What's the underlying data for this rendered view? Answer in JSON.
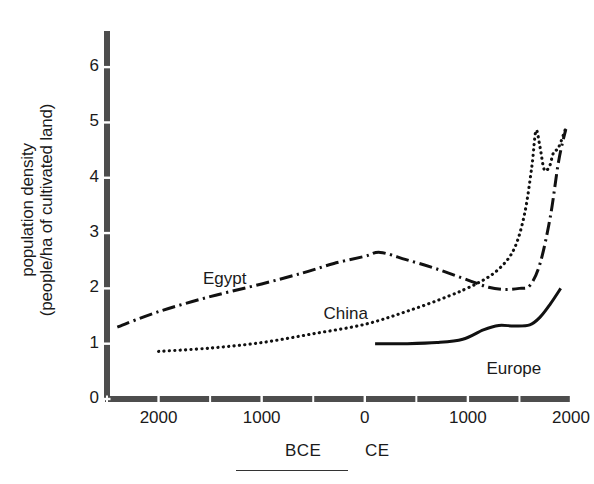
{
  "figure": {
    "axis_color": "#4d4d4d",
    "ink_color": "#111111"
  },
  "chart_data": {
    "type": "line",
    "title": "",
    "xlabel": "",
    "ylabel": "population density\n(people/ha of cultivated land)",
    "ylabel_line1": "population density",
    "ylabel_line2": "(people/ha of cultivated land)",
    "xlim": [
      -2500,
      2000
    ],
    "ylim": [
      0,
      6.4
    ],
    "grid": false,
    "legend": "inline-labels",
    "x_axis_caption_left": "BCE",
    "x_axis_caption_right": "CE",
    "y_ticks": [
      0,
      1,
      2,
      3,
      4,
      5,
      6
    ],
    "y_tick_labels": [
      "0",
      "1",
      "2",
      "3",
      "4",
      "5",
      "6"
    ],
    "x_ticks": [
      -2000,
      -1000,
      0,
      1000,
      2000
    ],
    "x_tick_labels": [
      "2000",
      "1000",
      "0",
      "1000",
      "2000"
    ],
    "series": [
      {
        "name": "Egypt",
        "style": "dash-dot",
        "color": "#111111",
        "label_x": -1550,
        "label_y": 2.35,
        "points": [
          [
            -2400,
            1.3
          ],
          [
            -2000,
            1.58
          ],
          [
            -1500,
            1.85
          ],
          [
            -1000,
            2.08
          ],
          [
            -600,
            2.28
          ],
          [
            -300,
            2.45
          ],
          [
            0,
            2.58
          ],
          [
            150,
            2.65
          ],
          [
            400,
            2.52
          ],
          [
            700,
            2.35
          ],
          [
            1000,
            2.15
          ],
          [
            1200,
            2.02
          ],
          [
            1350,
            1.98
          ],
          [
            1500,
            2.0
          ],
          [
            1600,
            2.05
          ],
          [
            1700,
            2.45
          ],
          [
            1800,
            3.3
          ],
          [
            1880,
            4.3
          ],
          [
            1950,
            4.88
          ]
        ]
      },
      {
        "name": "China",
        "style": "dotted",
        "color": "#111111",
        "label_x": -400,
        "label_y": 1.72,
        "points": [
          [
            -2000,
            0.86
          ],
          [
            -1500,
            0.92
          ],
          [
            -1000,
            1.02
          ],
          [
            -500,
            1.18
          ],
          [
            0,
            1.35
          ],
          [
            400,
            1.58
          ],
          [
            800,
            1.85
          ],
          [
            1100,
            2.1
          ],
          [
            1300,
            2.35
          ],
          [
            1450,
            2.72
          ],
          [
            1550,
            3.35
          ],
          [
            1620,
            4.2
          ],
          [
            1660,
            4.85
          ],
          [
            1700,
            4.55
          ],
          [
            1740,
            4.15
          ],
          [
            1790,
            4.2
          ],
          [
            1830,
            4.45
          ],
          [
            1880,
            4.55
          ],
          [
            1950,
            4.9
          ]
        ]
      },
      {
        "name": "Europe",
        "style": "solid",
        "color": "#111111",
        "label_x": 1180,
        "label_y": 0.72,
        "points": [
          [
            100,
            1.0
          ],
          [
            400,
            1.0
          ],
          [
            700,
            1.02
          ],
          [
            950,
            1.08
          ],
          [
            1150,
            1.25
          ],
          [
            1300,
            1.33
          ],
          [
            1450,
            1.32
          ],
          [
            1600,
            1.34
          ],
          [
            1700,
            1.48
          ],
          [
            1800,
            1.72
          ],
          [
            1900,
            2.0
          ]
        ]
      }
    ]
  },
  "footer": {
    "rule": "horizontal-rule"
  }
}
